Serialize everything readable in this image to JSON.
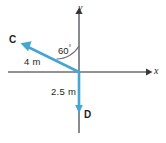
{
  "figure": {
    "type": "physics-vector-diagram",
    "axes": {
      "x_label": "x",
      "y_label": "y",
      "origin": [
        79,
        72
      ],
      "x_axis_from": [
        8,
        72
      ],
      "x_axis_to": [
        150,
        72
      ],
      "y_axis_from": [
        79,
        8
      ],
      "y_axis_to": [
        79,
        133
      ],
      "axis_color": "#6d6e71"
    },
    "vectors": [
      {
        "name": "C",
        "label": "C",
        "magnitude_label": "4 m",
        "color": "#45a6d4",
        "tail": [
          79,
          72
        ],
        "tip": [
          22,
          44
        ],
        "angle_from_y_axis_deg": 60
      },
      {
        "name": "D",
        "label": "D",
        "magnitude_label": "2.5 m",
        "color": "#45a6d4",
        "tail": [
          79,
          72
        ],
        "tip": [
          79,
          113
        ],
        "direction": "negative-y"
      }
    ],
    "angle": {
      "label": "60",
      "degree_symbol": "°",
      "value": 60,
      "between": [
        "y-axis",
        "vector-C"
      ],
      "arc_color": "#6d6e71"
    }
  }
}
